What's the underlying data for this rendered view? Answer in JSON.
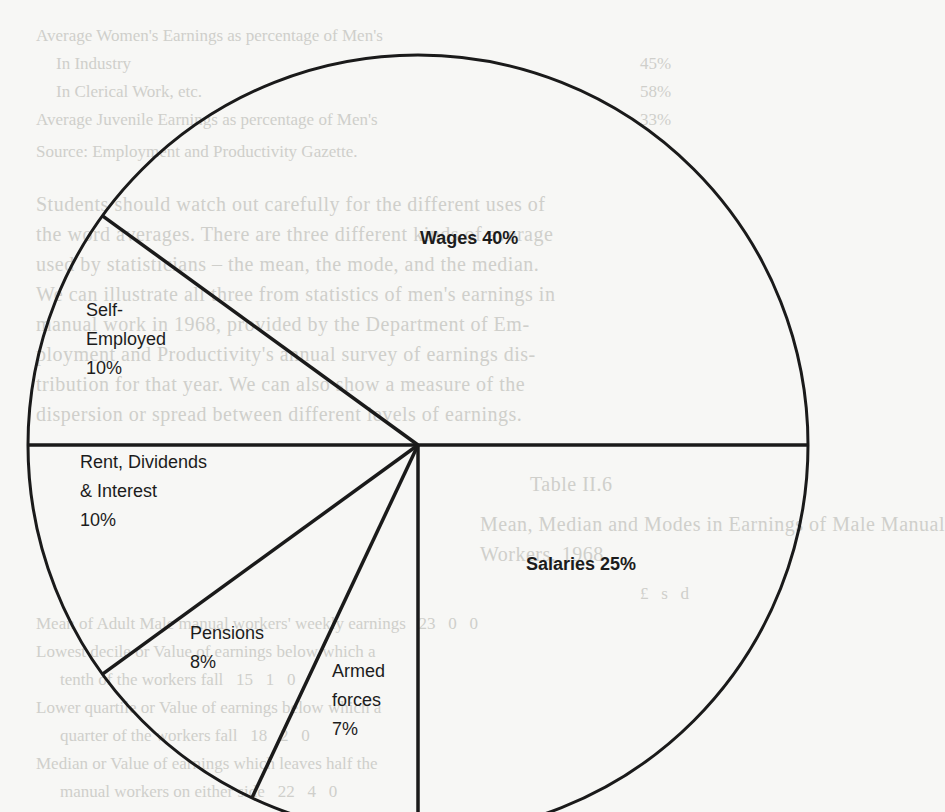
{
  "chart_data": {
    "type": "pie",
    "title": "",
    "start_angle_deg": 0,
    "direction": "counterclockwise",
    "categories": [
      "Wages",
      "Self-Employed",
      "Rent, Dividends & Interest",
      "Pensions",
      "Armed forces",
      "Salaries"
    ],
    "values": [
      40,
      10,
      10,
      8,
      7,
      25
    ],
    "unit": "%",
    "legend": "none (labels inside slices)"
  },
  "labels": {
    "wages": "Wages 40%",
    "self_employed": [
      "Self-",
      "Employed",
      "10%"
    ],
    "rent": [
      "Rent, Dividends",
      "& Interest",
      "10%"
    ],
    "pensions": [
      "Pensions",
      "8%"
    ],
    "armed": [
      "Armed",
      "forces",
      "7%"
    ],
    "salaries": "Salaries 25%"
  },
  "background_bleed": {
    "lines": [
      {
        "t": "Average Women's Earnings as percentage of Men's",
        "x": 36,
        "y": 22
      },
      {
        "t": "In Industry",
        "x": 56,
        "y": 50
      },
      {
        "t": "45%",
        "x": 640,
        "y": 50
      },
      {
        "t": "In Clerical Work, etc.",
        "x": 56,
        "y": 78
      },
      {
        "t": "58%",
        "x": 640,
        "y": 78
      },
      {
        "t": "Average Juvenile Earnings as percentage of Men's",
        "x": 36,
        "y": 106
      },
      {
        "t": "33%",
        "x": 640,
        "y": 106
      },
      {
        "t": "Source: Employment and Productivity Gazette.",
        "x": 36,
        "y": 138
      },
      {
        "t": "Students should watch out carefully for the different uses of",
        "x": 36,
        "y": 190,
        "big": true
      },
      {
        "t": "the word averages. There are three different kinds of average",
        "x": 36,
        "y": 220,
        "big": true
      },
      {
        "t": "used by statisticians – the mean, the mode, and the median.",
        "x": 36,
        "y": 250,
        "big": true
      },
      {
        "t": "We can illustrate all three from statistics of men's earnings in",
        "x": 36,
        "y": 280,
        "big": true
      },
      {
        "t": "manual work in 1968, provided by the Department of Em-",
        "x": 36,
        "y": 310,
        "big": true
      },
      {
        "t": "ployment and Productivity's annual survey of earnings dis-",
        "x": 36,
        "y": 340,
        "big": true
      },
      {
        "t": "tribution for that year. We can also show a measure of the",
        "x": 36,
        "y": 370,
        "big": true
      },
      {
        "t": "dispersion or spread between different levels of earnings.",
        "x": 36,
        "y": 400,
        "big": true
      },
      {
        "t": "Table II.6",
        "x": 530,
        "y": 470,
        "big": true
      },
      {
        "t": "Mean, Median and Modes in Earnings of Male Manual",
        "x": 480,
        "y": 510,
        "big": true
      },
      {
        "t": "Workers, 1968",
        "x": 480,
        "y": 540,
        "big": true
      },
      {
        "t": "£   s   d",
        "x": 640,
        "y": 580
      },
      {
        "t": "Mean of Adult Male manual workers' weekly earnings   23   0   0",
        "x": 36,
        "y": 610
      },
      {
        "t": "Lowest decile or Value of earnings below which a",
        "x": 36,
        "y": 638
      },
      {
        "t": "tenth of the workers fall   15   1   0",
        "x": 60,
        "y": 666
      },
      {
        "t": "Lower quartile or Value of earnings below which a",
        "x": 36,
        "y": 694
      },
      {
        "t": "quarter of the workers fall   18   2   0",
        "x": 60,
        "y": 722
      },
      {
        "t": "Median or Value of earnings which leaves half the",
        "x": 36,
        "y": 750
      },
      {
        "t": "manual workers on either side   22   4   0",
        "x": 60,
        "y": 778
      }
    ]
  }
}
